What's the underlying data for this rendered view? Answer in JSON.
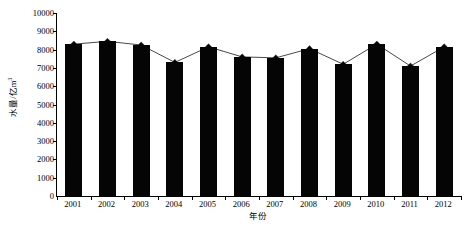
{
  "chart_data": {
    "type": "bar",
    "title": "",
    "subtitle": "",
    "xlabel": "年份",
    "ylabel": "水量/亿m",
    "ylabel_superscript": "3",
    "categories": [
      "2001",
      "2002",
      "2003",
      "2004",
      "2005",
      "2006",
      "2007",
      "2008",
      "2009",
      "2010",
      "2011",
      "2012"
    ],
    "values": [
      8300,
      8450,
      8250,
      7300,
      8150,
      7600,
      7550,
      8050,
      7200,
      8300,
      7100,
      8150
    ],
    "series": [
      {
        "name": "水量",
        "render": "bar",
        "values": [
          8300,
          8450,
          8250,
          7300,
          8150,
          7600,
          7550,
          8050,
          7200,
          8300,
          7100,
          8150
        ]
      },
      {
        "name": "水量趋势",
        "render": "line-marker",
        "marker": "diamond",
        "values": [
          8300,
          8450,
          8250,
          7300,
          8150,
          7600,
          7550,
          8050,
          7200,
          8300,
          7100,
          8150
        ]
      }
    ],
    "ylim": [
      0,
      10000
    ],
    "ytick_values": [
      0,
      1000,
      2000,
      3000,
      4000,
      5000,
      6000,
      7000,
      8000,
      9000,
      10000
    ],
    "ytick_labels": [
      "0",
      "1000",
      "2000",
      "3000",
      "4000",
      "5000",
      "6000",
      "7000",
      "8000",
      "9000",
      "10000"
    ],
    "grid": false,
    "legend": null,
    "legend_position": "none",
    "bar_color": "#050505",
    "line_color": "#1a1a1a",
    "marker_color": "#050505",
    "axis_color": "#000000",
    "background_color": "#ffffff"
  },
  "caption": {
    "text": ""
  }
}
